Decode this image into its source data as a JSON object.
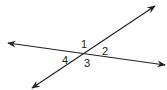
{
  "diagram": {
    "type": "intersecting-lines-angles",
    "line_color": "#222222",
    "lines": [
      {
        "name": "line-a",
        "x1": 8,
        "y1": 43,
        "x2": 165,
        "y2": 65
      },
      {
        "name": "line-b",
        "x1": 32,
        "y1": 88,
        "x2": 155,
        "y2": 6
      }
    ],
    "labels": [
      {
        "text": "1",
        "x": 81,
        "y": 48
      },
      {
        "text": "2",
        "x": 102,
        "y": 55
      },
      {
        "text": "4",
        "x": 62,
        "y": 64
      },
      {
        "text": "3",
        "x": 84,
        "y": 67
      }
    ]
  }
}
